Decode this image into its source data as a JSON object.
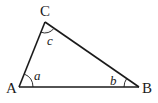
{
  "diagram": {
    "type": "triangle",
    "colors": {
      "stroke": "#1a1a1a",
      "background": "#ffffff"
    },
    "vertices": [
      {
        "id": "A",
        "label": "A",
        "x": 19,
        "y": 87
      },
      {
        "id": "B",
        "label": "B",
        "x": 139,
        "y": 87
      },
      {
        "id": "C",
        "label": "C",
        "x": 45,
        "y": 22
      }
    ],
    "edges": [
      {
        "from": "A",
        "to": "B"
      },
      {
        "from": "B",
        "to": "C"
      },
      {
        "from": "C",
        "to": "A"
      }
    ],
    "angles": [
      {
        "vertex": "A",
        "label": "a"
      },
      {
        "vertex": "B",
        "label": "b"
      },
      {
        "vertex": "C",
        "label": "c"
      }
    ]
  }
}
